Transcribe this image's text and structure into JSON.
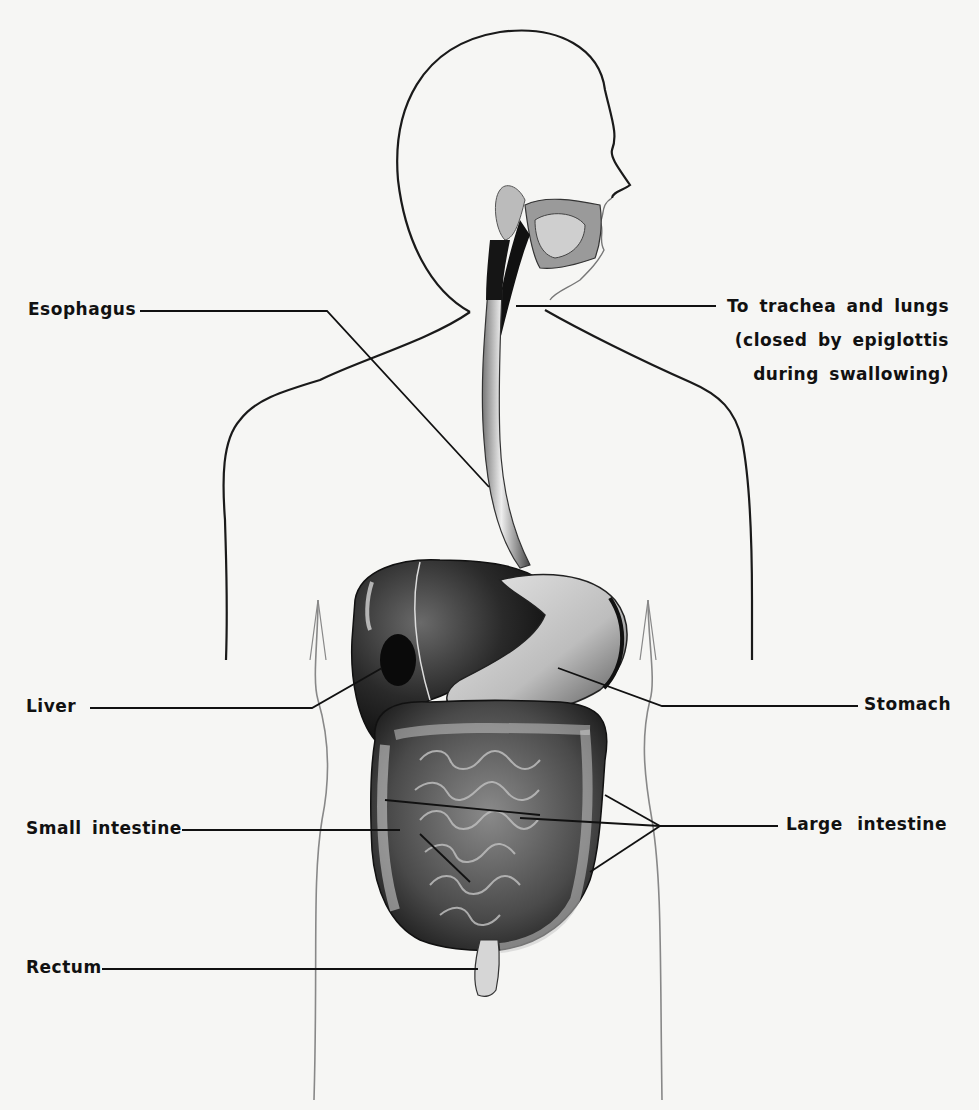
{
  "figure": {
    "labels": {
      "esophagus": "Esophagus",
      "trachea_line1": "To trachea and lungs",
      "trachea_line2": "(closed by epiglottis",
      "trachea_line3": "during swallowing)",
      "liver": "Liver",
      "stomach": "Stomach",
      "small_intestine": "Small intestine",
      "large_intestine": "Large intestine",
      "rectum": "Rectum"
    }
  }
}
